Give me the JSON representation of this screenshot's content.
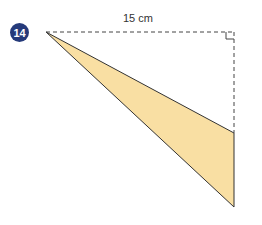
{
  "question": {
    "number": "14"
  },
  "diagram": {
    "top_length_label": "15 cm",
    "fill_color": "#f9dfa3",
    "stroke_color": "#333333"
  }
}
